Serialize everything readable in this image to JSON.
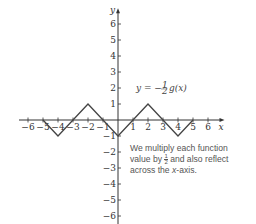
{
  "chart_data": {
    "type": "line",
    "title": "",
    "xlabel": "x",
    "ylabel": "y",
    "xlim": [
      -6,
      6
    ],
    "ylim": [
      -6,
      6
    ],
    "x_ticks": [
      -6,
      -5,
      -4,
      -3,
      -2,
      -1,
      1,
      2,
      3,
      4,
      5,
      6
    ],
    "y_ticks": [
      -6,
      -5,
      -4,
      -3,
      -2,
      -1,
      1,
      2,
      3,
      4,
      5,
      6
    ],
    "series": [
      {
        "name": "y = -1/2 g(x)",
        "x": [
          -5,
          -4,
          -2,
          0,
          2,
          4,
          5
        ],
        "y": [
          0,
          -1,
          1,
          -1,
          1,
          -1,
          0
        ]
      }
    ],
    "annotations": [
      {
        "text": "y = -½ g(x)",
        "x": 1.2,
        "y": 2
      },
      {
        "text": "We multiply each function value by ½ and also reflect across the x-axis.",
        "x": 1,
        "y": -2
      }
    ],
    "grid": false
  },
  "labels": {
    "x_axis": "x",
    "y_axis": "y",
    "equation": "y = −",
    "equation_tail": "g(x)",
    "frac_num": "1",
    "frac_den": "2",
    "note_line1": "We multiply each function",
    "note_line2a": "value by ",
    "note_line2b": " and also reflect",
    "note_line3a": "across the ",
    "note_line3b": "x",
    "note_line3c": "-axis."
  },
  "colors": {
    "axis": "#333333",
    "curve": "#444444",
    "text": "#555555"
  }
}
